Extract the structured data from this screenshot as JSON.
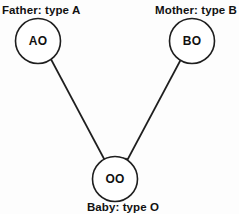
{
  "diagram": {
    "title_role": "blood-type-inheritance-punnett-pedigree",
    "background_color": "#fdfdfd",
    "stroke_color": "#1e1e1e",
    "text_color": "#111111",
    "nodes": [
      {
        "id": "father",
        "genotype": "AO",
        "caption": "Father: type A",
        "cx": 38,
        "cy": 41,
        "r": 22.5
      },
      {
        "id": "mother",
        "genotype": "BO",
        "caption": "Mother: type B",
        "cx": 192,
        "cy": 41,
        "r": 22.5
      },
      {
        "id": "baby",
        "genotype": "OO",
        "caption": "Baby: type O",
        "cx": 115,
        "cy": 179,
        "r": 22.5
      }
    ],
    "edges": [
      {
        "id": "father-to-baby",
        "from": "father",
        "to": "baby",
        "x1": 45,
        "y1": 48,
        "x2": 108,
        "y2": 167
      },
      {
        "id": "mother-to-baby",
        "from": "mother",
        "to": "baby",
        "x1": 187,
        "y1": 48,
        "x2": 124,
        "y2": 167
      }
    ]
  }
}
